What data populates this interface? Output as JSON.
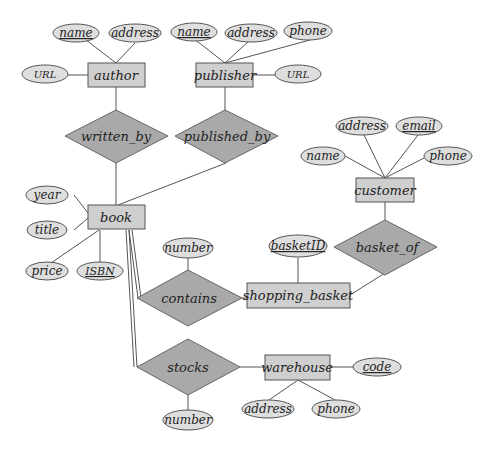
{
  "diagram": {
    "type": "ER diagram",
    "entities": {
      "author": "author",
      "publisher": "publisher",
      "book": "book",
      "customer": "customer",
      "shopping_basket": "shopping_basket",
      "warehouse": "warehouse"
    },
    "relationships": {
      "written_by": "written_by",
      "published_by": "published_by",
      "contains": "contains",
      "basket_of": "basket_of",
      "stocks": "stocks"
    },
    "attributes": {
      "author_name": "name",
      "author_address": "address",
      "author_url": "URL",
      "publisher_name": "name",
      "publisher_address": "address",
      "publisher_phone": "phone",
      "publisher_url": "URL",
      "book_year": "year",
      "book_title": "title",
      "book_price": "price",
      "book_isbn": "ISBN",
      "customer_address": "address",
      "customer_email": "email",
      "customer_name": "name",
      "customer_phone": "phone",
      "basket_id": "basketID",
      "contains_number": "number",
      "stocks_number": "number",
      "warehouse_code": "code",
      "warehouse_address": "address",
      "warehouse_phone": "phone"
    },
    "primary_keys": [
      "author.name",
      "publisher.name",
      "book.ISBN",
      "customer.email",
      "shopping_basket.basketID",
      "warehouse.code"
    ],
    "total_participation": [
      "book-contains",
      "book-stocks"
    ]
  }
}
